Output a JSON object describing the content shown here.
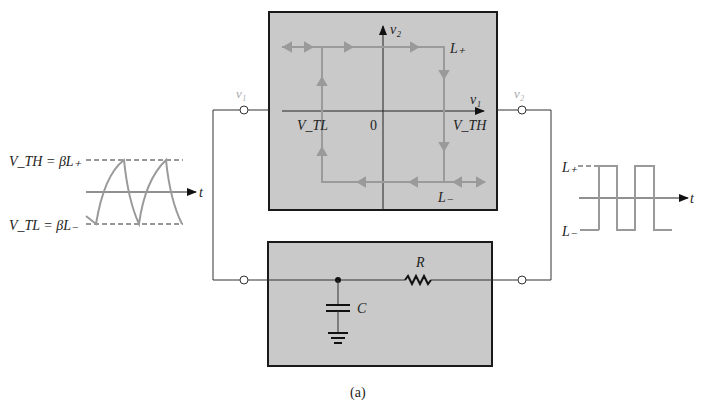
{
  "figure": {
    "caption": "(a)",
    "colors": {
      "box_fill": "#c9c9c9",
      "box_border": "#1a1a1a",
      "trace": "#9a9a9a",
      "wire": "#333333"
    },
    "transfer_box": {
      "y_axis_label": "v₂",
      "x_axis_label": "v₁",
      "origin_label": "0",
      "upper_level_label": "L₊",
      "lower_level_label": "L₋",
      "low_threshold_label": "V_TL",
      "high_threshold_label": "V_TH"
    },
    "input_terminal_label": "v₁",
    "output_terminal_label": "v₂",
    "input_waveform": {
      "upper_threshold_eq": "V_TH = βL₊",
      "lower_threshold_eq": "V_TL = βL₋",
      "time_label": "t"
    },
    "output_waveform": {
      "upper_label": "L₊",
      "lower_label": "L₋",
      "time_label": "t"
    },
    "rc_network": {
      "resistor_label": "R",
      "capacitor_label": "C"
    }
  }
}
